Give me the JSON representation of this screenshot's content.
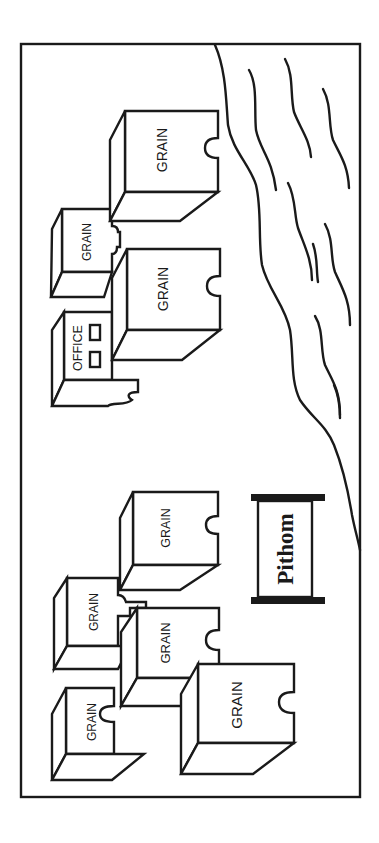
{
  "scene": {
    "orientation": "rotated 90 degrees clockwise",
    "colors": {
      "ink": "#1a1a1a",
      "background": "#ffffff"
    }
  },
  "sign": {
    "label": "Pithom"
  },
  "office": {
    "label": "OFFICE"
  },
  "granaries": [
    {
      "id": "a",
      "label": "GRAIN"
    },
    {
      "id": "b",
      "label": "GRAIN"
    },
    {
      "id": "c",
      "label": "GRAIN"
    },
    {
      "id": "d",
      "label": "GRAIN"
    },
    {
      "id": "e",
      "label": "GRAIN"
    },
    {
      "id": "f",
      "label": "GRAIN"
    },
    {
      "id": "g",
      "label": "GRAIN"
    },
    {
      "id": "h",
      "label": "GRAIN"
    }
  ],
  "river": {
    "name": "river-with-waves"
  }
}
